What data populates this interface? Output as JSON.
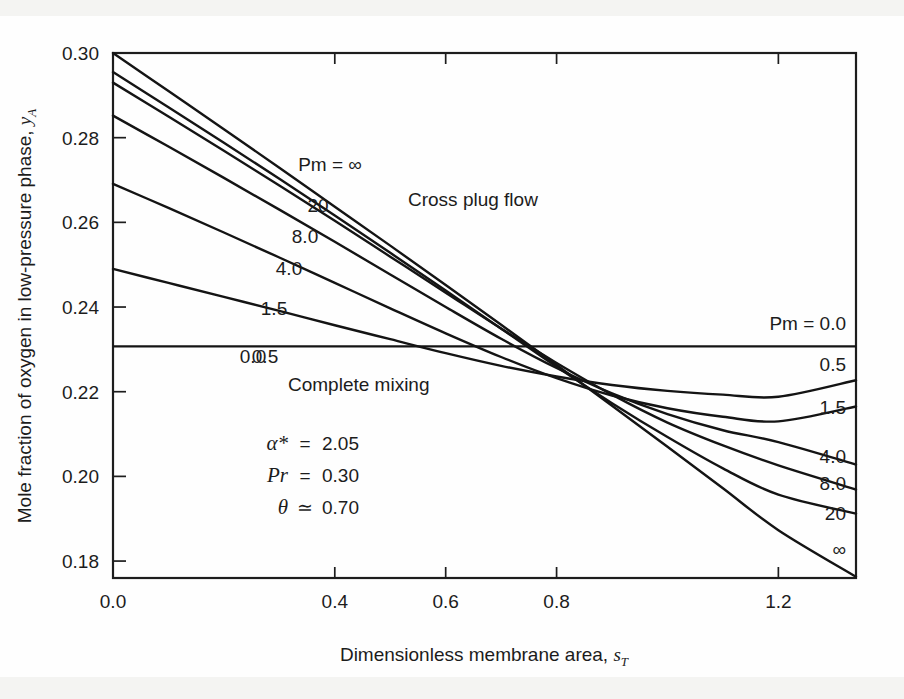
{
  "figure": {
    "background_color": "#fefefe",
    "ink_color": "#141414"
  },
  "chart_data": {
    "type": "line",
    "title": "",
    "xlabel_prefix": "Dimensionless membrane area, ",
    "xlabel_symbol": "s",
    "xlabel_subscript": "T",
    "ylabel_prefix": "Mole fraction of oxygen in low-pressure phase, ",
    "ylabel_symbol": "y",
    "ylabel_subscript": "A",
    "xlim": [
      0.0,
      1.34
    ],
    "ylim": [
      0.176,
      0.3
    ],
    "xticks": [
      0.0,
      0.4,
      0.6,
      0.8,
      1.2
    ],
    "xtick_labels": [
      "0.0",
      "0.4",
      "0.6",
      "0.8",
      "1.2"
    ],
    "yticks": [
      0.18,
      0.2,
      0.22,
      0.24,
      0.26,
      0.28,
      0.3
    ],
    "ytick_labels": [
      "0.18",
      "0.20",
      "0.22",
      "0.24",
      "0.26",
      "0.28",
      "0.30"
    ],
    "grid": false,
    "legend_position": "inline-curve-labels",
    "x": [
      0.0,
      0.1,
      0.2,
      0.3,
      0.4,
      0.5,
      0.6,
      0.7,
      0.8,
      0.9,
      1.0,
      1.1,
      1.2,
      1.34
    ],
    "series": [
      {
        "name": "Pm = inf",
        "label_left": "Pm = ∞",
        "label_right": "∞",
        "values": [
          0.3,
          0.291,
          0.282,
          0.2729,
          0.2637,
          0.2545,
          0.2452,
          0.2358,
          0.2263,
          0.2167,
          0.207,
          0.1972,
          0.1873,
          0.1763
        ]
      },
      {
        "name": "Pm = 20",
        "label_left": "20",
        "label_right": "20",
        "values": [
          0.2955,
          0.2872,
          0.2788,
          0.2703,
          0.2616,
          0.2528,
          0.2439,
          0.2349,
          0.2259,
          0.2173,
          0.2093,
          0.2019,
          0.1957,
          0.1912
        ]
      },
      {
        "name": "Pm = 8.0",
        "label_left": "8.0",
        "label_right": "8.0",
        "values": [
          0.293,
          0.285,
          0.2769,
          0.2687,
          0.2604,
          0.2519,
          0.2434,
          0.2349,
          0.2268,
          0.2193,
          0.2127,
          0.2073,
          0.2026,
          0.1969
        ]
      },
      {
        "name": "Pm = 4.0",
        "label_left": "4.0",
        "label_right": "4.0",
        "values": [
          0.2852,
          0.2779,
          0.2705,
          0.263,
          0.2554,
          0.2477,
          0.24,
          0.2325,
          0.2256,
          0.2196,
          0.2147,
          0.2109,
          0.2081,
          0.2028
        ]
      },
      {
        "name": "Pm = 1.5",
        "label_left": "1.5",
        "label_right": "1.5",
        "values": [
          0.2691,
          0.2634,
          0.2576,
          0.2517,
          0.2457,
          0.2397,
          0.2338,
          0.2282,
          0.2232,
          0.2191,
          0.2161,
          0.2141,
          0.213,
          0.2165
        ]
      },
      {
        "name": "Pm = 0.5",
        "label_left": "0.5",
        "label_right": "0.5",
        "values": [
          0.249,
          0.2457,
          0.2424,
          0.2391,
          0.2357,
          0.2324,
          0.2291,
          0.2261,
          0.2236,
          0.2216,
          0.2202,
          0.2193,
          0.2188,
          0.2227
        ]
      },
      {
        "name": "Pm = 0.0",
        "label_left": "0.0",
        "label_right": "Pm = 0.0",
        "values": [
          0.2307,
          0.2307,
          0.2307,
          0.2307,
          0.2307,
          0.2307,
          0.2307,
          0.2307,
          0.2307,
          0.2307,
          0.2307,
          0.2307,
          0.2307,
          0.2307
        ]
      }
    ],
    "annotations": [
      {
        "name": "cross-plug-flow",
        "text": "Cross plug flow",
        "x_px": 408,
        "y_px": 206
      },
      {
        "name": "complete-mixing",
        "text": "Complete mixing",
        "x_px": 288,
        "y_px": 391
      }
    ],
    "parameters": [
      {
        "name": "alpha-star",
        "symbol": "α*",
        "relation": "=",
        "value": "2.05"
      },
      {
        "name": "pressure-ratio",
        "symbol": "Pr",
        "relation": "=",
        "value": "0.30"
      },
      {
        "name": "theta",
        "symbol": "θ",
        "relation": "≃",
        "value": "0.70"
      }
    ],
    "left_curve_labels": [
      {
        "name": "label-pm-inf",
        "text": "Pm = ∞",
        "x_px": 330,
        "y_px": 171
      },
      {
        "name": "label-pm-20",
        "text": "20",
        "x_px": 318,
        "y_px": 212
      },
      {
        "name": "label-pm-8",
        "text": "8.0",
        "x_px": 305,
        "y_px": 243
      },
      {
        "name": "label-pm-4",
        "text": "4.0",
        "x_px": 289,
        "y_px": 275
      },
      {
        "name": "label-pm-1p5",
        "text": "1.5",
        "x_px": 274,
        "y_px": 315
      },
      {
        "name": "label-pm-0p5",
        "text": "0.5",
        "x_px": 265,
        "y_px": 363
      },
      {
        "name": "label-pm-0",
        "text": "0.0",
        "x_px": 253,
        "y_px": 363
      }
    ],
    "right_curve_labels": [
      {
        "name": "label-right-pm-0",
        "text": "Pm = 0.0",
        "x_px": 846,
        "y_px": 330
      },
      {
        "name": "label-right-pm-0p5",
        "text": "0.5",
        "x_px": 846,
        "y_px": 371
      },
      {
        "name": "label-right-pm-1p5",
        "text": "1.5",
        "x_px": 846,
        "y_px": 414
      },
      {
        "name": "label-right-pm-4",
        "text": "4.0",
        "x_px": 846,
        "y_px": 463
      },
      {
        "name": "label-right-pm-8",
        "text": "8.0",
        "x_px": 846,
        "y_px": 490
      },
      {
        "name": "label-right-pm-20",
        "text": "20",
        "x_px": 846,
        "y_px": 520
      },
      {
        "name": "label-right-pm-inf",
        "text": "∞",
        "x_px": 846,
        "y_px": 556
      }
    ]
  }
}
